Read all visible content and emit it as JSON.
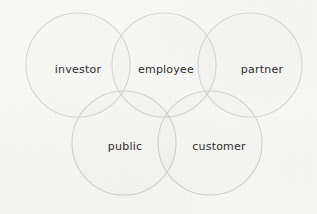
{
  "diagram": {
    "type": "venn",
    "title": "",
    "background_color": "#f8f8f6",
    "stroke_color": "#d4d4d2",
    "label_color": "#2c2c2c",
    "circle_radius": 52,
    "circles": [
      {
        "id": "investor",
        "label": "investor",
        "cx": 78,
        "cy": 65,
        "r": 52,
        "row": "top"
      },
      {
        "id": "employee",
        "label": "employee",
        "cx": 164,
        "cy": 65,
        "r": 52,
        "row": "top"
      },
      {
        "id": "partner",
        "label": "partner",
        "cx": 250,
        "cy": 65,
        "r": 52,
        "row": "top"
      },
      {
        "id": "public",
        "label": "public",
        "cx": 124,
        "cy": 143,
        "r": 52,
        "row": "bottom"
      },
      {
        "id": "customer",
        "label": "customer",
        "cx": 210,
        "cy": 143,
        "r": 52,
        "row": "bottom"
      }
    ],
    "labels": [
      {
        "text": "investor",
        "x": 78,
        "y": 69
      },
      {
        "text": "employee",
        "x": 166,
        "y": 69
      },
      {
        "text": "partner",
        "x": 262,
        "y": 69
      },
      {
        "text": "public",
        "x": 125,
        "y": 146
      },
      {
        "text": "customer",
        "x": 219,
        "y": 146
      }
    ]
  }
}
